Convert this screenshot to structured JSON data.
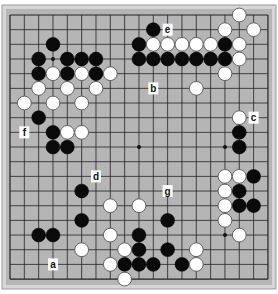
{
  "board": {
    "size": 19,
    "frame_color": "#d6d6d6",
    "board_color": "#b5b5b5",
    "line_color": "#222222",
    "origin_x": 10,
    "origin_y": 15,
    "spacing_x": 14.33,
    "spacing_y": 14.67,
    "star_points": [
      [
        3,
        3
      ],
      [
        9,
        3
      ],
      [
        15,
        3
      ],
      [
        3,
        9
      ],
      [
        9,
        9
      ],
      [
        15,
        9
      ],
      [
        3,
        15
      ],
      [
        9,
        15
      ],
      [
        15,
        15
      ]
    ]
  },
  "stones": {
    "black": [
      [
        10,
        1
      ],
      [
        3,
        2
      ],
      [
        9,
        2
      ],
      [
        15,
        2
      ],
      [
        2,
        3
      ],
      [
        4,
        3
      ],
      [
        5,
        3
      ],
      [
        6,
        3
      ],
      [
        9,
        3
      ],
      [
        10,
        3
      ],
      [
        11,
        3
      ],
      [
        12,
        3
      ],
      [
        13,
        3
      ],
      [
        14,
        3
      ],
      [
        15,
        3
      ],
      [
        2,
        4
      ],
      [
        4,
        4
      ],
      [
        6,
        4
      ],
      [
        2,
        7
      ],
      [
        3,
        8
      ],
      [
        16,
        8
      ],
      [
        3,
        9
      ],
      [
        4,
        9
      ],
      [
        16,
        9
      ],
      [
        17,
        11
      ],
      [
        5,
        12
      ],
      [
        16,
        12
      ],
      [
        16,
        13
      ],
      [
        17,
        13
      ],
      [
        5,
        14
      ],
      [
        11,
        14
      ],
      [
        2,
        15
      ],
      [
        3,
        15
      ],
      [
        9,
        15
      ],
      [
        9,
        16
      ],
      [
        11,
        16
      ],
      [
        8,
        17
      ],
      [
        9,
        17
      ],
      [
        10,
        17
      ],
      [
        12,
        17
      ]
    ],
    "white": [
      [
        16,
        0
      ],
      [
        15,
        1
      ],
      [
        17,
        1
      ],
      [
        10,
        2
      ],
      [
        11,
        2
      ],
      [
        12,
        2
      ],
      [
        13,
        2
      ],
      [
        14,
        2
      ],
      [
        16,
        2
      ],
      [
        3,
        4
      ],
      [
        5,
        4
      ],
      [
        7,
        4
      ],
      [
        16,
        3
      ],
      [
        15,
        4
      ],
      [
        2,
        5
      ],
      [
        4,
        5
      ],
      [
        6,
        5
      ],
      [
        13,
        5
      ],
      [
        1,
        6
      ],
      [
        3,
        6
      ],
      [
        5,
        6
      ],
      [
        16,
        7
      ],
      [
        4,
        8
      ],
      [
        5,
        8
      ],
      [
        15,
        11
      ],
      [
        16,
        11
      ],
      [
        15,
        12
      ],
      [
        7,
        13
      ],
      [
        9,
        13
      ],
      [
        15,
        13
      ],
      [
        15,
        14
      ],
      [
        7,
        15
      ],
      [
        16,
        15
      ],
      [
        5,
        16
      ],
      [
        8,
        16
      ],
      [
        13,
        16
      ],
      [
        7,
        17
      ],
      [
        13,
        17
      ],
      [
        8,
        18
      ]
    ]
  },
  "labels": [
    {
      "text": "a",
      "col": 3,
      "row": 17
    },
    {
      "text": "b",
      "col": 10,
      "row": 5
    },
    {
      "text": "c",
      "col": 17,
      "row": 7
    },
    {
      "text": "d",
      "col": 6,
      "row": 11
    },
    {
      "text": "e",
      "col": 11,
      "row": 1
    },
    {
      "text": "f",
      "col": 1,
      "row": 8
    },
    {
      "text": "g",
      "col": 11,
      "row": 12
    }
  ]
}
